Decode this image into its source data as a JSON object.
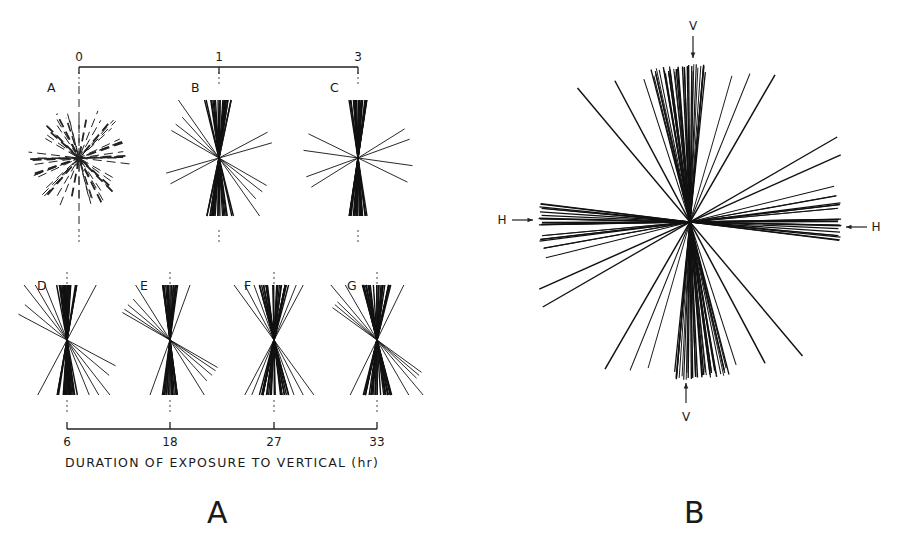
{
  "figure": {
    "panels": [
      {
        "id": "A",
        "caption": "A"
      },
      {
        "id": "B",
        "caption": "B"
      }
    ]
  },
  "panelA": {
    "top_scale": {
      "ticks": [
        {
          "label": "0",
          "x": 79
        },
        {
          "label": "1",
          "x": 219
        },
        {
          "label": "3",
          "x": 358
        }
      ],
      "y": 67
    },
    "bottom_scale": {
      "ticks": [
        {
          "label": "6",
          "x": 67
        },
        {
          "label": "18",
          "x": 170
        },
        {
          "label": "27",
          "x": 274
        },
        {
          "label": "33",
          "x": 377
        }
      ],
      "y": 429,
      "title": "DURATION OF EXPOSURE TO VERTICAL (hr)"
    },
    "rosettes": [
      {
        "label": "A",
        "hours": "0",
        "cx": 79,
        "cy": 158,
        "dashed": true
      },
      {
        "label": "B",
        "hours": "1",
        "cx": 219,
        "cy": 158,
        "dashed": false
      },
      {
        "label": "C",
        "hours": "3",
        "cx": 358,
        "cy": 158,
        "dashed": false
      },
      {
        "label": "D",
        "hours": "6",
        "cx": 67,
        "cy": 340,
        "dashed": false
      },
      {
        "label": "E",
        "hours": "18",
        "cx": 170,
        "cy": 340,
        "dashed": false
      },
      {
        "label": "F",
        "hours": "27",
        "cx": 274,
        "cy": 340,
        "dashed": false
      },
      {
        "label": "G",
        "hours": "33",
        "cx": 377,
        "cy": 340,
        "dashed": false
      }
    ]
  },
  "panelB": {
    "center": {
      "x": 690,
      "y": 222
    },
    "arrows": {
      "top": "V",
      "bottom": "V",
      "left": "H",
      "right": "H"
    }
  },
  "chart_data": {
    "type": "rosette",
    "xlabel": "DURATION OF EXPOSURE TO VERTICAL (hr)",
    "panel_A_timepoints_hr": [
      0,
      1,
      3,
      6,
      18,
      27,
      33
    ],
    "panel_A_sublabels": [
      "A",
      "B",
      "C",
      "D",
      "E",
      "F",
      "G"
    ],
    "panel_A_description": "0 hr: random orientation (dashed lines); 1-3 hr: lines converge toward vertical; 6-33 hr: narrow vertical bundles with some tilted lines",
    "panel_B_description": "Cross-shaped distribution with clusters along vertical (V) and horizontal (H) axes",
    "panel_B_axis_labels": [
      "V",
      "V",
      "H",
      "H"
    ]
  }
}
